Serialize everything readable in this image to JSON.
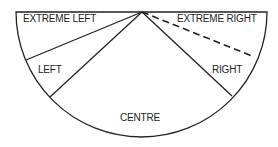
{
  "diagram": {
    "type": "semicircle political spectrum",
    "segments": [
      {
        "label": "EXTREME LEFT"
      },
      {
        "label": "LEFT"
      },
      {
        "label": "CENTRE"
      },
      {
        "label": "RIGHT"
      },
      {
        "label": "EXTREME RIGHT"
      }
    ],
    "line_color": "#222222",
    "dashed_boundary": "between RIGHT and EXTREME RIGHT"
  }
}
